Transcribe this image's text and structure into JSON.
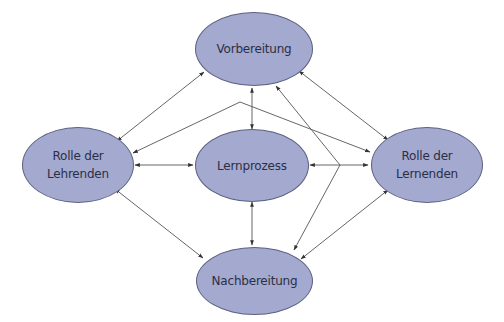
{
  "diagram": {
    "colors": {
      "node_fill": "#a3a9cf",
      "node_stroke": "#5c6180",
      "edge": "#555555",
      "text": "#2b2f45"
    },
    "nodes": [
      {
        "id": "vorbereitung",
        "label": "Vorbereitung"
      },
      {
        "id": "lehrende",
        "label": "Rolle der\nLehrenden"
      },
      {
        "id": "lernprozess",
        "label": "Lernprozess"
      },
      {
        "id": "lernende",
        "label": "Rolle der\nLernenden"
      },
      {
        "id": "nachbereitung",
        "label": "Nachbereitung"
      }
    ],
    "edges": [
      {
        "from": "vorbereitung",
        "to": "lehrende",
        "type": "bidirectional"
      },
      {
        "from": "vorbereitung",
        "to": "lernende",
        "type": "bidirectional"
      },
      {
        "from": "vorbereitung",
        "to": "lernprozess",
        "type": "bidirectional"
      },
      {
        "from": "lehrende",
        "to": "lernprozess",
        "type": "bidirectional"
      },
      {
        "from": "lernprozess",
        "to": "lernende",
        "type": "bidirectional"
      },
      {
        "from": "lernprozess",
        "to": "nachbereitung",
        "type": "bidirectional"
      },
      {
        "from": "lehrende",
        "to": "nachbereitung",
        "type": "bidirectional"
      },
      {
        "from": "lernende",
        "to": "nachbereitung",
        "type": "bidirectional"
      },
      {
        "from": "vorbereitung",
        "to": "lernende",
        "type": "directed",
        "note": "from upper-left of Vorbereitung area to Lernende"
      },
      {
        "from": "junction",
        "to": "lehrende",
        "type": "directed"
      },
      {
        "from": "junction",
        "to": "vorbereitung",
        "type": "directed"
      },
      {
        "from": "junction",
        "to": "nachbereitung",
        "type": "directed"
      }
    ]
  }
}
